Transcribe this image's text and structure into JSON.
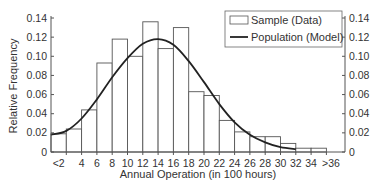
{
  "chart_data": {
    "type": "bar",
    "title": "",
    "xlabel": "Annual Operation (in 100 hours)",
    "ylabel": "Relative Frequency",
    "ylim": [
      0,
      0.14
    ],
    "grid": false,
    "legend_position": "upper right",
    "x_tick_labels": [
      "<2",
      "4",
      "6",
      "8",
      "10",
      "12",
      "14",
      "16",
      "18",
      "20",
      "22",
      "24",
      "26",
      "28",
      "30",
      "32",
      "34",
      ">36"
    ],
    "y_tick_labels": [
      "0",
      "0.02",
      "0.04",
      "0.06",
      "0.08",
      "0.10",
      "0.12",
      "0.14"
    ],
    "categories": [
      "<2",
      "2-4",
      "4-6",
      "6-8",
      "8-10",
      "10-12",
      "12-14",
      "14-16",
      "16-18",
      "18-20",
      "20-22",
      "22-24",
      "24-26",
      "26-28",
      "28-30",
      "30-32",
      "32-34",
      "34->36"
    ],
    "series": [
      {
        "name": "Sample (Data)",
        "type": "bar",
        "values": [
          0.019,
          0.024,
          0.044,
          0.093,
          0.118,
          0.1,
          0.136,
          0.108,
          0.13,
          0.063,
          0.059,
          0.033,
          0.021,
          0.016,
          0.016,
          0.009,
          0.004,
          0.004
        ]
      },
      {
        "name": "Population (Model)",
        "type": "line",
        "x": [
          0,
          2,
          4,
          6,
          8,
          10,
          12,
          14,
          16,
          18,
          20,
          22,
          24,
          26,
          28,
          30,
          32
        ],
        "values": [
          0.018,
          0.022,
          0.035,
          0.055,
          0.078,
          0.098,
          0.113,
          0.118,
          0.112,
          0.095,
          0.073,
          0.05,
          0.031,
          0.018,
          0.01,
          0.005,
          0.003
        ]
      }
    ]
  },
  "legend": {
    "items": [
      {
        "label": "Sample (Data)",
        "symbol": "open-rectangle"
      },
      {
        "label": "Population (Model)",
        "symbol": "line"
      }
    ]
  },
  "axes": {
    "x_title": "Annual Operation (in 100 hours)",
    "y_title": "Relative Frequency"
  },
  "colors": {
    "bar_stroke": "#555555",
    "bar_fill": "#ffffff",
    "curve": "#222222",
    "axis": "#555555",
    "text": "#333333"
  }
}
